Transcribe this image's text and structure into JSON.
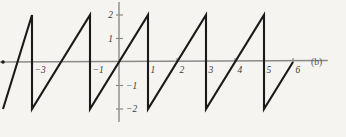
{
  "figure": {
    "panel_label": "(b)",
    "background_color": "#f6f4f0",
    "axis_color": "#8a8a8a",
    "curve_color": "#1a1a1a",
    "tick_color": "#3a3a3a"
  },
  "chart_data": {
    "type": "line",
    "title": "",
    "subtitle": "",
    "xlabel": "",
    "ylabel": "",
    "annotations": [
      "(b)"
    ],
    "grid": false,
    "legend": null,
    "xlim": [
      -4.6,
      7.2
    ],
    "ylim": [
      -2.6,
      2.6
    ],
    "xticks": [
      -3,
      -1,
      1,
      2,
      3,
      4,
      5,
      6
    ],
    "xticklabels": [
      "−3",
      "−1",
      "1",
      "2",
      "3",
      "4",
      "5",
      "6"
    ],
    "yticks": [
      2,
      1,
      -1,
      -2
    ],
    "yticklabels": [
      "2",
      "1",
      "−1",
      "−2"
    ],
    "waveform": {
      "name": "sawtooth",
      "period": 2,
      "amplitude_min": -2,
      "amplitude_max": 2,
      "description": "Sawtooth: rises linearly from -2 to 2 over each period of 2, then drops vertically back to -2 at odd integers.",
      "segments": [
        {
          "x0": -4.0,
          "y0": -2,
          "x1": -3.0,
          "y1": 2
        },
        {
          "x0": -3.0,
          "y0": 2,
          "x1": -3.0,
          "y1": -2
        },
        {
          "x0": -3.0,
          "y0": -2,
          "x1": -1.0,
          "y1": 2
        },
        {
          "x0": -1.0,
          "y0": 2,
          "x1": -1.0,
          "y1": -2
        },
        {
          "x0": -1.0,
          "y0": -2,
          "x1": 1.0,
          "y1": 2
        },
        {
          "x0": 1.0,
          "y0": 2,
          "x1": 1.0,
          "y1": -2
        },
        {
          "x0": 1.0,
          "y0": -2,
          "x1": 3.0,
          "y1": 2
        },
        {
          "x0": 3.0,
          "y0": 2,
          "x1": 3.0,
          "y1": -2
        },
        {
          "x0": 3.0,
          "y0": -2,
          "x1": 5.0,
          "y1": 2
        },
        {
          "x0": 5.0,
          "y0": 2,
          "x1": 5.0,
          "y1": -2
        },
        {
          "x0": 5.0,
          "y0": -2,
          "x1": 6.0,
          "y1": 0
        }
      ],
      "points": [
        {
          "x": -4.0,
          "y": -2
        },
        {
          "x": -3.0,
          "y": 2
        },
        {
          "x": -3.0,
          "y": -2
        },
        {
          "x": -1.0,
          "y": 2
        },
        {
          "x": -1.0,
          "y": -2
        },
        {
          "x": 1.0,
          "y": 2
        },
        {
          "x": 1.0,
          "y": -2
        },
        {
          "x": 3.0,
          "y": 2
        },
        {
          "x": 3.0,
          "y": -2
        },
        {
          "x": 5.0,
          "y": 2
        },
        {
          "x": 5.0,
          "y": -2
        },
        {
          "x": 6.0,
          "y": 0
        }
      ]
    }
  }
}
